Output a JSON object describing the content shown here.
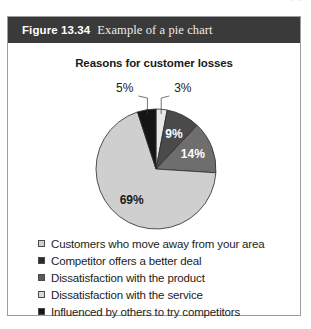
{
  "page": {
    "top_cut_text": "p     g"
  },
  "figure": {
    "number": "Figure 13.34",
    "caption": "Example of a pie chart",
    "header_bg": "#3a3a3a",
    "border_color": "#9d9d9d"
  },
  "chart_data": {
    "type": "pie",
    "title": "Reasons for customer losses",
    "xlabel": "",
    "ylabel": "",
    "legend_position": "bottom",
    "grid": false,
    "categories": [
      "Customers who move away from your area",
      "Competitor offers a better deal",
      "Dissatisfaction with the product",
      "Dissatisfaction with the service",
      "Influenced by others to try competitors"
    ],
    "values": [
      3,
      9,
      14,
      69,
      5
    ],
    "value_labels": [
      "3%",
      "9%",
      "14%",
      "69%",
      "5%"
    ],
    "colors": [
      "#e8e8e8",
      "#4a4a4a",
      "#6e6e6e",
      "#cfcfcf",
      "#151515"
    ],
    "label_colors": [
      "#1a1a1a",
      "#ffffff",
      "#ffffff",
      "#1a1a1a",
      "#1a1a1a"
    ],
    "slices": [
      {
        "label": "3%",
        "value": 3,
        "color": "#e8e8e8",
        "label_color": "#1a1a1a",
        "callout": true
      },
      {
        "label": "9%",
        "value": 9,
        "color": "#4a4a4a",
        "label_color": "#ffffff",
        "callout": false
      },
      {
        "label": "14%",
        "value": 14,
        "color": "#6e6e6e",
        "label_color": "#ffffff",
        "callout": false
      },
      {
        "label": "69%",
        "value": 69,
        "color": "#cfcfcf",
        "label_color": "#1a1a1a",
        "callout": false
      },
      {
        "label": "5%",
        "value": 5,
        "color": "#151515",
        "label_color": "#1a1a1a",
        "callout": true
      }
    ]
  },
  "legend": {
    "items": [
      {
        "label": "Customers who move away from your area",
        "color": "#cfcfcf"
      },
      {
        "label": "Competitor offers a better deal",
        "color": "#2a2a2a"
      },
      {
        "label": "Dissatisfaction with the product",
        "color": "#5a5a5a"
      },
      {
        "label": "Dissatisfaction with the service",
        "color": "#d8d8d8"
      },
      {
        "label": "Influenced by others to try competitors",
        "color": "#151515"
      }
    ]
  }
}
